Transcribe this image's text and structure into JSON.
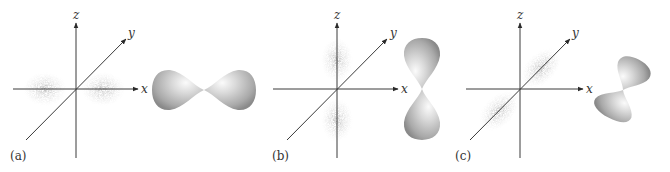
{
  "figure": {
    "colors": {
      "axis": "#3a3a3a",
      "dots": "#888888",
      "lobe_light": "#f2f2f2",
      "lobe_mid": "#c4c4c4",
      "lobe_dark": "#8e8e8e"
    },
    "panels": [
      {
        "id": "a",
        "label": "(a)",
        "orbital": "px",
        "axes": {
          "z_label": "z",
          "y_label": "y",
          "x_label": "x"
        }
      },
      {
        "id": "b",
        "label": "(b)",
        "orbital": "pz",
        "axes": {
          "z_label": "z",
          "y_label": "y",
          "x_label": "x"
        }
      },
      {
        "id": "c",
        "label": "(c)",
        "orbital": "py",
        "axes": {
          "z_label": "z",
          "y_label": "y",
          "x_label": "x"
        }
      }
    ]
  }
}
